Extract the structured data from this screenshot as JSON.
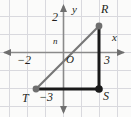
{
  "figure": {
    "type": "coordinate-grid-geometry",
    "width": 131,
    "height": 117,
    "background_color": "#fbfbfa",
    "grid": {
      "visible": true,
      "color": "#d9d9de",
      "spacing_px": 18,
      "x_range": [
        -3.55,
        3.7
      ],
      "y_range": [
        -4.1,
        3.1
      ]
    },
    "axes": {
      "color": "#8a8a8a",
      "x_label": "x",
      "y_label": "y",
      "origin_label": "O",
      "arrowheads": [
        "left",
        "right",
        "up",
        "down"
      ]
    },
    "tick_labels": [
      {
        "name": "tick-y-2",
        "text": "2",
        "axis": "y",
        "value": 2,
        "x_px": 52,
        "y_px": 16
      },
      {
        "name": "tick-y-n",
        "text": "n",
        "axis": "y",
        "value": 1,
        "x_px": 53,
        "y_px": 39
      },
      {
        "name": "tick-x-neg2",
        "text": "−2",
        "axis": "x",
        "value": -2,
        "x_px": 18,
        "y_px": 53
      },
      {
        "name": "tick-x-3",
        "text": "3",
        "axis": "x",
        "value": 3,
        "x_px": 96,
        "y_px": 53
      },
      {
        "name": "tick-y-neg3",
        "text": "−3",
        "axis": "y",
        "value": -3,
        "x_px": 40,
        "y_px": 92
      }
    ],
    "shape": {
      "name": "triangle-RST",
      "kind": "right-triangle",
      "vertices": [
        {
          "label": "R",
          "x": 3,
          "y": 2,
          "px": 99,
          "py": 26,
          "point_style": "filled-gray",
          "point_color": "#6f6f6f",
          "label_px": 103,
          "label_py": 5
        },
        {
          "label": "S",
          "x": 3,
          "y": -3,
          "px": 99,
          "py": 89,
          "point_style": "filled-black",
          "point_color": "#1a1a1a",
          "label_px": 103,
          "label_py": 92
        },
        {
          "label": "T",
          "x": -2,
          "y": -3,
          "px": 36,
          "py": 89,
          "point_style": "filled-gray",
          "point_color": "#6f6f6f",
          "label_px": 22,
          "label_py": 93
        }
      ],
      "edges": [
        {
          "name": "leg-RS",
          "from": "R",
          "to": "S",
          "style": "thick",
          "color": "#1a1a1a",
          "width_px": 3
        },
        {
          "name": "leg-TS",
          "from": "T",
          "to": "S",
          "style": "thick",
          "color": "#1a1a1a",
          "width_px": 3
        },
        {
          "name": "hypotenuse-TR",
          "from": "T",
          "to": "R",
          "style": "thin",
          "color": "#777777",
          "width_px": 2
        }
      ]
    },
    "axis_labels": [
      {
        "name": "x-axis-label",
        "text": "x",
        "x_px": 112,
        "y_px": 35
      },
      {
        "name": "y-axis-label",
        "text": "y",
        "x_px": 73,
        "y_px": 7
      }
    ]
  }
}
